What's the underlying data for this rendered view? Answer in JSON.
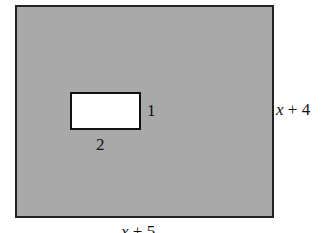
{
  "figure": {
    "outer_rect": {
      "width_label_var": "x",
      "width_label_rest": " + 5",
      "height_label_var": "x",
      "height_label_rest": " + 4",
      "fill": "#a9a9a9"
    },
    "inner_rect": {
      "width_label": "2",
      "height_label": "1",
      "fill": "#ffffff"
    }
  }
}
